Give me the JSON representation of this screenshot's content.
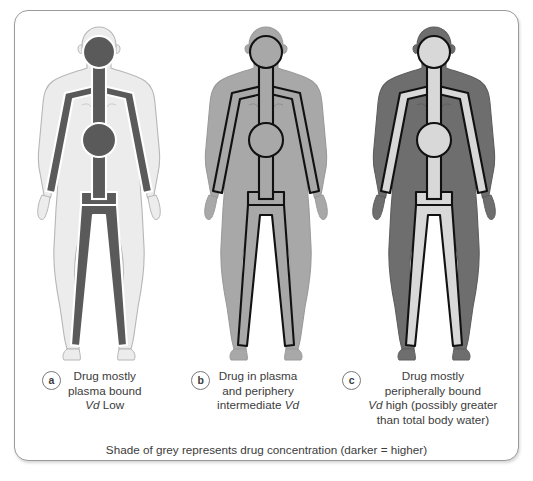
{
  "panel": {
    "legend": "Shade of grey represents drug concentration (darker = higher)"
  },
  "figures": [
    {
      "key": "a",
      "marker": "a",
      "caption_lines": [
        "Drug mostly",
        "plasma bound"
      ],
      "caption_vd_line": {
        "italic": "Vd",
        "rest": " Low"
      },
      "body_fill": "#ECECEC",
      "body_stroke": "#B6B6B6",
      "vessel_fill": "#5A5A5A",
      "vessel_stroke": "#FFFFFF",
      "detail_stroke": "#C9C9C9"
    },
    {
      "key": "b",
      "marker": "b",
      "caption_lines": [
        "Drug in plasma",
        "and periphery"
      ],
      "caption_vd_line": {
        "rest": "intermediate ",
        "italic": "Vd"
      },
      "body_fill": "#A8A8A8",
      "body_stroke": "#9A9A9A",
      "vessel_fill": "#A8A8A8",
      "vessel_stroke": "#111111",
      "detail_stroke": "#8E8E8E"
    },
    {
      "key": "c",
      "marker": "c",
      "caption_lines": [
        "Drug mostly",
        "peripherally bound"
      ],
      "caption_vd_line": {
        "italic": "Vd",
        "rest": " high (possibly greater"
      },
      "caption_extra_line": "than total body water)",
      "body_fill": "#6E6E6E",
      "body_stroke": "#5E5E5E",
      "vessel_fill": "#D8D8D8",
      "vessel_stroke": "#111111",
      "detail_stroke": "#5E5E5E"
    }
  ]
}
